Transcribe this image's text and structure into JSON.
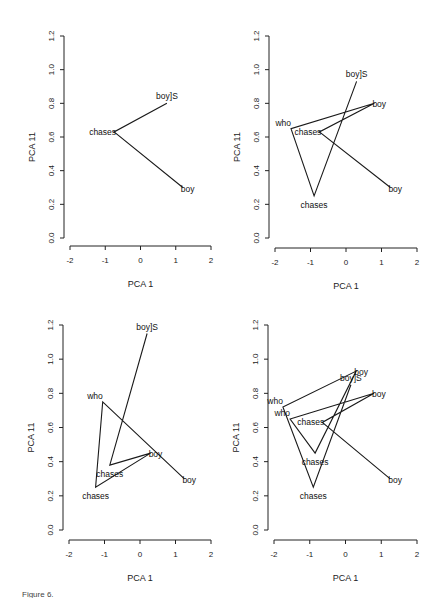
{
  "caption": "Figure 6.",
  "chart_data": [
    {
      "type": "line",
      "title": "",
      "xlabel": "PCA 1",
      "ylabel": "PCA 11",
      "xlim": [
        -2,
        2
      ],
      "ylim": [
        0.0,
        1.2
      ],
      "xticks": [
        "-2",
        "-1",
        "0",
        "1",
        "2"
      ],
      "yticks": [
        "0.0",
        "0.2",
        "0.4",
        "0.6",
        "0.8",
        "1.0",
        "1.2"
      ],
      "grid": false,
      "series": [
        {
          "name": "trajectory",
          "points": [
            {
              "label": "boy",
              "x": 1.2,
              "y": 0.3
            },
            {
              "label": "chases",
              "x": -0.75,
              "y": 0.63
            },
            {
              "label": "boy]S",
              "x": 0.75,
              "y": 0.8
            }
          ]
        }
      ]
    },
    {
      "type": "line",
      "title": "",
      "xlabel": "PCA 1",
      "ylabel": "PCA 11",
      "xlim": [
        -2,
        2
      ],
      "ylim": [
        0.0,
        1.2
      ],
      "xticks": [
        "-2",
        "-1",
        "0",
        "1",
        "2"
      ],
      "yticks": [
        "0.0",
        "0.2",
        "0.4",
        "0.6",
        "0.8",
        "1.0",
        "1.2"
      ],
      "grid": false,
      "series": [
        {
          "name": "trajectory",
          "points": [
            {
              "label": "boy",
              "x": 1.25,
              "y": 0.3
            },
            {
              "label": "chases",
              "x": -0.75,
              "y": 0.63
            },
            {
              "label": "boy",
              "x": 0.8,
              "y": 0.8
            },
            {
              "label": "who",
              "x": -1.55,
              "y": 0.65
            },
            {
              "label": "chases",
              "x": -0.9,
              "y": 0.25
            },
            {
              "label": "boy]S",
              "x": 0.3,
              "y": 0.93
            }
          ]
        }
      ]
    },
    {
      "type": "line",
      "title": "",
      "xlabel": "PCA 1",
      "ylabel": "PCA 11",
      "xlim": [
        -2,
        2
      ],
      "ylim": [
        0.0,
        1.2
      ],
      "xticks": [
        "-2",
        "-1",
        "0",
        "1",
        "2"
      ],
      "yticks": [
        "0.0",
        "0.2",
        "0.4",
        "0.6",
        "0.8",
        "1.0",
        "1.2"
      ],
      "grid": false,
      "series": [
        {
          "name": "trajectory",
          "points": [
            {
              "label": "boy",
              "x": 1.25,
              "y": 0.3
            },
            {
              "label": "who",
              "x": -1.05,
              "y": 0.75
            },
            {
              "label": "chases",
              "x": -1.25,
              "y": 0.25
            },
            {
              "label": "boy",
              "x": 0.3,
              "y": 0.45
            },
            {
              "label": "chases",
              "x": -0.85,
              "y": 0.38
            },
            {
              "label": "boy]S",
              "x": 0.2,
              "y": 1.15
            }
          ]
        }
      ]
    },
    {
      "type": "line",
      "title": "",
      "xlabel": "PCA 1",
      "ylabel": "PCA 11",
      "xlim": [
        -2,
        2
      ],
      "ylim": [
        0.0,
        1.2
      ],
      "xticks": [
        "-2",
        "-1",
        "0",
        "1",
        "2"
      ],
      "yticks": [
        "0.0",
        "0.2",
        "0.4",
        "0.6",
        "0.8",
        "1.0",
        "1.2"
      ],
      "grid": false,
      "series": [
        {
          "name": "trajectory",
          "points": [
            {
              "label": "boy",
              "x": 1.25,
              "y": 0.3
            },
            {
              "label": "chases",
              "x": -0.65,
              "y": 0.63
            },
            {
              "label": "boy",
              "x": 0.8,
              "y": 0.8
            },
            {
              "label": "who",
              "x": -1.55,
              "y": 0.65
            },
            {
              "label": "chases",
              "x": -0.85,
              "y": 0.45
            },
            {
              "label": "boy",
              "x": 0.3,
              "y": 0.93
            },
            {
              "label": "who",
              "x": -1.75,
              "y": 0.72
            },
            {
              "label": "chases",
              "x": -0.9,
              "y": 0.25
            },
            {
              "label": "boy]S",
              "x": 0.15,
              "y": 0.85
            }
          ]
        }
      ]
    }
  ]
}
